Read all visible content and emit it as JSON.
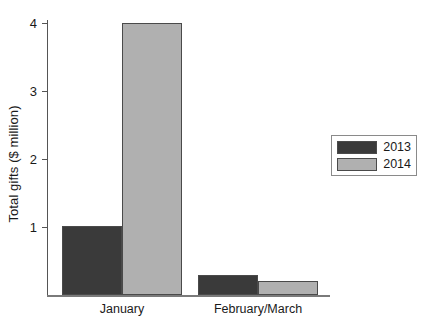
{
  "chart_data": {
    "type": "bar",
    "title": "",
    "xlabel": "",
    "ylabel": "Total gifts ($ million)",
    "categories": [
      "January",
      "February/March"
    ],
    "series": [
      {
        "name": "2013",
        "color": "#3a3a3a",
        "values": [
          1.02,
          0.3
        ]
      },
      {
        "name": "2014",
        "color": "#b0b0b0",
        "values": [
          4.0,
          0.2
        ]
      }
    ],
    "ylim": [
      0,
      4.35
    ],
    "yticks": [
      1,
      2,
      3,
      4
    ],
    "ytick_labels": [
      "1",
      "2",
      "3",
      "4"
    ],
    "grid": false,
    "legend_position": "right"
  },
  "legend": {
    "entries": [
      {
        "label": "2013"
      },
      {
        "label": "2014"
      }
    ]
  }
}
